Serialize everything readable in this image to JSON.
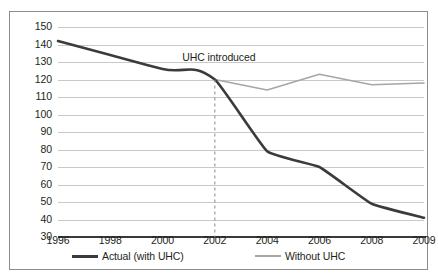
{
  "chart_data": {
    "type": "line",
    "title": "",
    "xlabel": "",
    "ylabel": "",
    "categories": [
      "1996",
      "1998",
      "2000",
      "2002",
      "2004",
      "2006",
      "2008",
      "2009"
    ],
    "ylim": [
      30,
      150
    ],
    "ytick_labels": [
      "150",
      "140",
      "130",
      "120",
      "110",
      "100",
      "90",
      "80",
      "70",
      "60",
      "50",
      "40",
      "30"
    ],
    "ytick_values": [
      150,
      140,
      130,
      120,
      110,
      100,
      90,
      80,
      70,
      60,
      50,
      40,
      30
    ],
    "grid": true,
    "legend_position": "bottom",
    "series": [
      {
        "name": "Actual (with UHC)",
        "color": "#3b3b3b",
        "values": [
          142,
          134,
          126,
          120,
          79,
          70,
          49,
          41
        ]
      },
      {
        "name": "Without UHC",
        "color": "#a6a6a6",
        "values": [
          null,
          null,
          null,
          120,
          114,
          123,
          117,
          118
        ]
      }
    ],
    "annotations": [
      {
        "text": "UHC introduced",
        "at_category": "2002",
        "style": "dashed-vertical-line",
        "line_color": "#8a8a8a"
      }
    ]
  },
  "legend": {
    "items": [
      {
        "label": "Actual (with UHC)",
        "color": "#3b3b3b"
      },
      {
        "label": "Without UHC",
        "color": "#a6a6a6"
      }
    ]
  }
}
